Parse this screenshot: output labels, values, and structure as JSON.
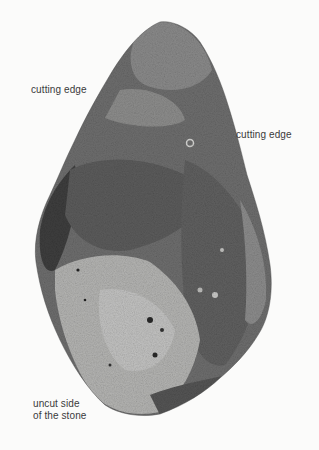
{
  "figure": {
    "colors": {
      "background": "#fbfbfa",
      "stone_dark": "#5a5a5a",
      "stone_mid": "#777777",
      "stone_light": "#b8b8b6",
      "label_text": "#3a3a3a"
    },
    "labels": {
      "cutting_edge_left": "cutting edge",
      "cutting_edge_right": "cutting edge",
      "uncut_side_line1": "uncut side",
      "uncut_side_line2": "of the stone"
    }
  }
}
